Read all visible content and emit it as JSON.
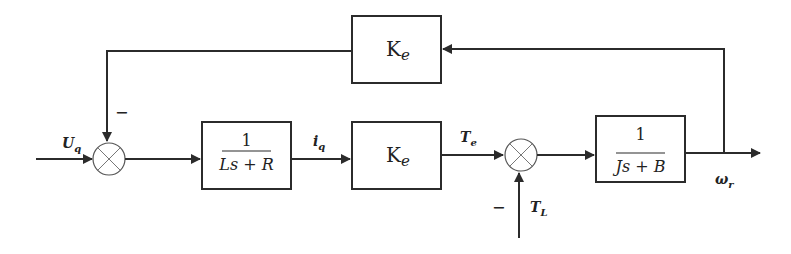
{
  "diagram": {
    "type": "block-diagram",
    "blocks": {
      "feedback_gain": {
        "label": "K",
        "subscript": "e"
      },
      "electrical": {
        "numerator": "1",
        "denominator": "Ls + R"
      },
      "torque_gain": {
        "label": "K",
        "subscript": "e"
      },
      "mechanical": {
        "numerator": "1",
        "denominator": "Js + B"
      }
    },
    "signals": {
      "input": {
        "label": "U",
        "subscript": "q"
      },
      "current": {
        "label": "i",
        "subscript": "q"
      },
      "electromagnetic_torque": {
        "label": "T",
        "subscript": "e"
      },
      "load_torque": {
        "label": "T",
        "subscript": "L"
      },
      "output": {
        "label": "ω",
        "subscript": "r"
      }
    },
    "summing_junctions": [
      {
        "name": "voltage-sum",
        "feedback_sign": "−"
      },
      {
        "name": "torque-sum",
        "disturbance_sign": "−"
      }
    ],
    "colors": {
      "line": "#2b2b2b",
      "background": "#ffffff"
    }
  }
}
